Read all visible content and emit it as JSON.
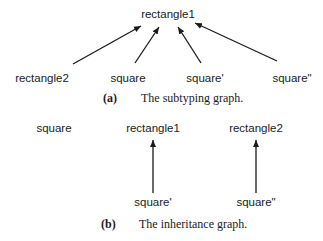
{
  "figure_a": {
    "caption_label": "(a)",
    "caption_text": "The subtyping graph.",
    "nodes": {
      "rectangle1": "rectangle1",
      "rectangle2": "rectangle2",
      "square": "square",
      "square_prime": "square'",
      "square_double_prime": "square\""
    },
    "edges": [
      {
        "from": "rectangle2",
        "to": "rectangle1"
      },
      {
        "from": "square",
        "to": "rectangle1"
      },
      {
        "from": "square'",
        "to": "rectangle1"
      },
      {
        "from": "square\"",
        "to": "rectangle1"
      }
    ]
  },
  "figure_b": {
    "caption_label": "(b)",
    "caption_text": "The inheritance graph.",
    "nodes": {
      "square": "square",
      "rectangle1": "rectangle1",
      "rectangle2": "rectangle2",
      "square_prime": "square'",
      "square_double_prime": "square\""
    },
    "edges": [
      {
        "from": "square'",
        "to": "rectangle1"
      },
      {
        "from": "square\"",
        "to": "rectangle2"
      }
    ]
  }
}
